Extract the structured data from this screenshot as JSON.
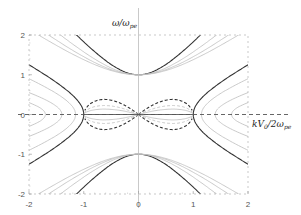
{
  "chart_data": {
    "type": "line",
    "title": "",
    "xlabel": "kV₀/2ωpe",
    "xlabel_main": "kV",
    "xlabel_sub0": "0",
    "xlabel_mid": "/2ω",
    "xlabel_sub1": "pe",
    "ylabel_main": "ω/ω",
    "ylabel_sub": "pe",
    "xlim": [
      -2,
      2
    ],
    "ylim": [
      -2,
      2
    ],
    "xticks": [
      -2,
      -1,
      0,
      1,
      2
    ],
    "yticks": [
      -2,
      -1,
      0,
      1,
      2
    ],
    "xtick_labels": [
      "-2",
      "-1",
      "0",
      "1",
      "2"
    ],
    "ytick_labels": [
      "-2",
      "-1",
      "0",
      "1",
      "2"
    ],
    "grid": false,
    "legend": "none",
    "series": [
      {
        "name": "upper-branch",
        "style": "solid",
        "shade": "dark",
        "family": "upper",
        "param": 0.62
      },
      {
        "name": "upper-branch-light-1",
        "style": "solid",
        "shade": "light",
        "family": "upper",
        "param": 0.78
      },
      {
        "name": "upper-branch-light-2",
        "style": "solid",
        "shade": "light",
        "family": "upper",
        "param": 0.9
      },
      {
        "name": "upper-branch-light-3",
        "style": "solid",
        "shade": "light",
        "family": "upper",
        "param": 1.0
      },
      {
        "name": "side-branch",
        "style": "solid",
        "shade": "dark",
        "family": "side",
        "vertex": 1.0,
        "end_value": 1.25
      },
      {
        "name": "side-branch-light-1",
        "style": "solid",
        "shade": "light",
        "family": "side",
        "vertex": 1.15,
        "end_value": 0.9
      },
      {
        "name": "side-branch-light-2",
        "style": "solid",
        "shade": "light",
        "family": "side",
        "vertex": 1.4,
        "end_value": 0.55
      },
      {
        "name": "side-branch-light-3",
        "style": "solid",
        "shade": "light",
        "family": "side",
        "vertex": 1.7,
        "end_value": 0.3
      },
      {
        "name": "lens-outer",
        "style": "dashed",
        "shade": "dark",
        "family": "lens",
        "peak": 0.42
      },
      {
        "name": "lens-inner",
        "style": "dashed",
        "shade": "light",
        "family": "lens",
        "peak": 0.25
      },
      {
        "name": "lens-inner-solid",
        "style": "solid",
        "shade": "light",
        "family": "lens",
        "peak": 0.15
      }
    ]
  }
}
